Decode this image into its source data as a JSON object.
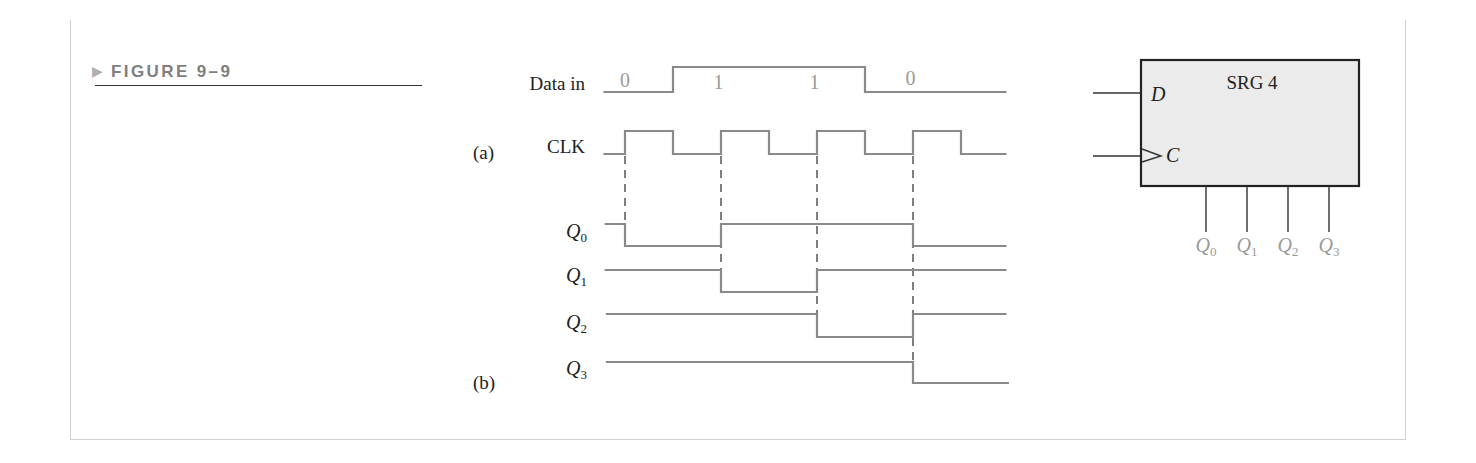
{
  "figure": {
    "marker": "▶",
    "title": "FIGURE 9–9"
  },
  "timing_diagram": {
    "part_labels": {
      "a": "(a)",
      "b": "(b)"
    },
    "signals": [
      {
        "id": "data_in",
        "label": "Data in",
        "sub": "",
        "start": 0.1,
        "end": 16.9,
        "levels": [
          [
            0,
            0
          ],
          [
            3,
            1
          ],
          [
            11,
            0
          ]
        ]
      },
      {
        "id": "clk",
        "label": "CLK",
        "sub": "",
        "start": 0.1,
        "end": 16.9,
        "levels": [
          [
            0,
            0
          ],
          [
            1,
            1
          ],
          [
            3,
            0
          ],
          [
            5,
            1
          ],
          [
            7,
            0
          ],
          [
            9,
            1
          ],
          [
            11,
            0
          ],
          [
            13,
            1
          ],
          [
            15,
            0
          ]
        ]
      },
      {
        "id": "q0",
        "label": "Q",
        "sub": "0",
        "start": 0.15,
        "end": 16.9,
        "levels": [
          [
            0,
            1
          ],
          [
            1,
            0
          ],
          [
            5,
            1
          ],
          [
            13,
            0
          ]
        ]
      },
      {
        "id": "q1",
        "label": "Q",
        "sub": "1",
        "start": 0.15,
        "end": 16.9,
        "levels": [
          [
            0,
            1
          ],
          [
            5,
            0
          ],
          [
            9,
            1
          ]
        ]
      },
      {
        "id": "q2",
        "label": "Q",
        "sub": "2",
        "start": 0.2,
        "end": 16.9,
        "levels": [
          [
            0,
            1
          ],
          [
            9,
            0
          ],
          [
            13,
            1
          ]
        ]
      },
      {
        "id": "q3",
        "label": "Q",
        "sub": "3",
        "start": 0.2,
        "end": 17.0,
        "levels": [
          [
            0,
            1
          ],
          [
            13,
            0
          ]
        ]
      }
    ],
    "data_bits": [
      {
        "t": 1,
        "value": "0"
      },
      {
        "t": 4.9,
        "value": "1"
      },
      {
        "t": 8.9,
        "value": "1"
      },
      {
        "t": 12.9,
        "value": "0"
      }
    ],
    "clock_triggers": [
      {
        "t": 1,
        "to": "q0"
      },
      {
        "t": 5,
        "to": "q1"
      },
      {
        "t": 9,
        "to": "q2"
      },
      {
        "t": 13,
        "to": "q3"
      }
    ]
  },
  "register": {
    "name": "SRG 4",
    "inputs": [
      {
        "label": "D",
        "clock": false
      },
      {
        "label": "C",
        "clock": true
      }
    ],
    "outputs": [
      {
        "label": "Q",
        "sub": "0"
      },
      {
        "label": "Q",
        "sub": "1"
      },
      {
        "label": "Q",
        "sub": "2"
      },
      {
        "label": "Q",
        "sub": "3"
      }
    ]
  },
  "colors": {
    "waveform": "#8a8a8a",
    "guide": "#3a3a3a",
    "data_bit": "#9a9a9a",
    "box_fill": "#ebebeb",
    "box_stroke": "#222222",
    "output_label": "#9a9a9a",
    "title": "#7f7f7f",
    "marker": "#b0b0b0"
  }
}
